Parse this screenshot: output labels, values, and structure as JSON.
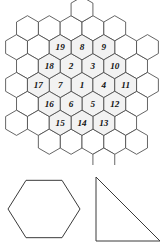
{
  "figure": {
    "background_color": "#ffffff"
  },
  "hex_grid": {
    "name": "hexagonal-tiling-grid",
    "stroke_color": "#4a4a4a",
    "numbered_fill_color": "#f2f2f2",
    "empty_fill_color": "#ffffff",
    "hex_radius": 12.6,
    "orientation": "pointy-top",
    "center_cell": {
      "q": 0,
      "r": 0,
      "label": "1"
    },
    "numbered_cells": [
      {
        "label": "1",
        "q": 0,
        "r": 0
      },
      {
        "label": "2",
        "q": 0,
        "r": -1
      },
      {
        "label": "3",
        "q": 1,
        "r": -1
      },
      {
        "label": "4",
        "q": 1,
        "r": 0
      },
      {
        "label": "5",
        "q": 0,
        "r": 1
      },
      {
        "label": "6",
        "q": -1,
        "r": 1
      },
      {
        "label": "7",
        "q": -1,
        "r": 0
      },
      {
        "label": "8",
        "q": 1,
        "r": -2
      },
      {
        "label": "9",
        "q": 2,
        "r": -2
      },
      {
        "label": "10",
        "q": 2,
        "r": -1
      },
      {
        "label": "11",
        "q": 2,
        "r": 0
      },
      {
        "label": "12",
        "q": 1,
        "r": 1
      },
      {
        "label": "13",
        "q": 0,
        "r": 2
      },
      {
        "label": "14",
        "q": -1,
        "r": 2
      },
      {
        "label": "15",
        "q": -2,
        "r": 2
      },
      {
        "label": "16",
        "q": -2,
        "r": 1
      },
      {
        "label": "17",
        "q": -2,
        "r": 0
      },
      {
        "label": "18",
        "q": -1,
        "r": -1
      },
      {
        "label": "19",
        "q": 0,
        "r": -2
      }
    ],
    "empty_cells": [
      {
        "q": 0,
        "r": -3
      },
      {
        "q": 1,
        "r": -3
      },
      {
        "q": -1,
        "r": -2
      },
      {
        "q": 2,
        "r": -3
      },
      {
        "q": -2,
        "r": -1
      },
      {
        "q": 3,
        "r": -3
      },
      {
        "q": 3,
        "r": -2
      },
      {
        "q": -3,
        "r": 0
      },
      {
        "q": -3,
        "r": 1
      },
      {
        "q": 3,
        "r": -1
      },
      {
        "q": -3,
        "r": 2
      },
      {
        "q": 3,
        "r": 0
      },
      {
        "q": -2,
        "r": 3
      },
      {
        "q": 2,
        "r": 1
      },
      {
        "q": -1,
        "r": 3
      },
      {
        "q": 1,
        "r": 2
      },
      {
        "q": 0,
        "r": 3
      },
      {
        "q": -3,
        "r": 3
      },
      {
        "q": 2,
        "r": -4
      },
      {
        "q": -2,
        "r": -2
      },
      {
        "q": -4,
        "r": 2
      },
      {
        "q": 4,
        "r": -2
      },
      {
        "q": -1,
        "r": -3
      },
      {
        "q": -1,
        "r": 4
      },
      {
        "q": 1,
        "r": 3
      }
    ]
  },
  "shapes": {
    "hexagon": {
      "name": "hexagon-outline",
      "stroke_color": "#3a3a3a",
      "center_x": 44,
      "center_y": 44,
      "radius": 36,
      "orientation": "flat-top"
    },
    "triangle": {
      "name": "right-triangle-outline",
      "stroke_color": "#3a3a3a",
      "apex_x": 96,
      "apex_y": 12,
      "base_left_x": 96,
      "base_left_y": 76,
      "base_right_x": 160,
      "base_right_y": 76
    }
  }
}
